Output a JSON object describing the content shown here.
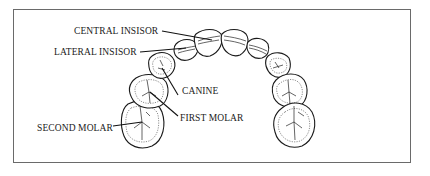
{
  "diagram": {
    "labels": {
      "central_incisor": "CENTRAL INSISOR",
      "lateral_incisor": "LATERAL INSISOR",
      "canine": "CANINE",
      "first_molar": "FIRST MOLAR",
      "second_molar": "SECOND MOLAR"
    },
    "teeth": [
      "left-second-molar",
      "left-first-molar",
      "left-canine",
      "left-lateral-incisor",
      "left-central-incisor",
      "right-central-incisor",
      "right-lateral-incisor",
      "right-canine",
      "right-first-molar",
      "right-second-molar"
    ],
    "colors": {
      "line": "#1a1a1a",
      "border": "#6a6a6a",
      "background": "#ffffff"
    }
  }
}
